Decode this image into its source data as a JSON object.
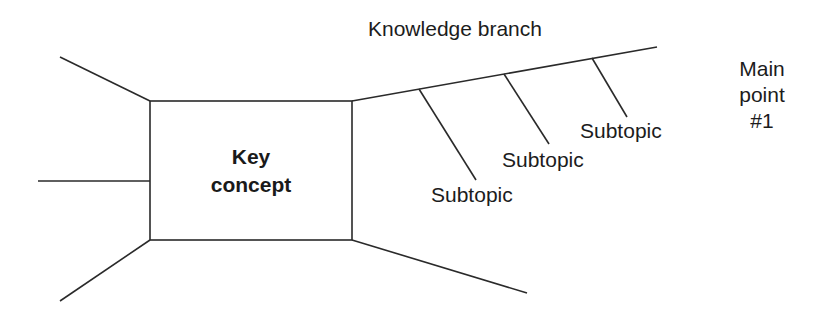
{
  "diagram": {
    "type": "knowledge-map",
    "key_concept": {
      "line1": "Key",
      "line2": "concept"
    },
    "branch": {
      "label": "Knowledge branch",
      "main_point": {
        "line1": "Main",
        "line2": "point",
        "line3": "#1"
      },
      "subtopics": [
        {
          "label": "Subtopic"
        },
        {
          "label": "Subtopic"
        },
        {
          "label": "Subtopic"
        }
      ]
    },
    "colors": {
      "line": "#2a2a2a",
      "text": "#1c1c1c",
      "background": "#ffffff"
    }
  }
}
